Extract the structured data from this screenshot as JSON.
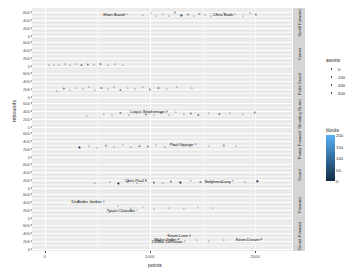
{
  "chart_data": {
    "type": "scatter",
    "title": "",
    "xlabel": "points",
    "ylabel": "rebounds",
    "xlim": [
      -120,
      2350
    ],
    "xticks": [
      0,
      1000,
      2000
    ],
    "grid": true,
    "facet_variable": "position-group",
    "legend_position": "right",
    "facets": [
      {
        "strip": "Small Forward",
        "yticks": [
          0,
          200,
          400,
          600
        ],
        "ylim": [
          -60,
          700
        ],
        "points": [
          {
            "x": 780,
            "y": 560,
            "assists": 180,
            "blocks": 40,
            "label": "Elton Brand"
          },
          {
            "x": 930,
            "y": 520,
            "assists": 120,
            "blocks": 30
          },
          {
            "x": 1010,
            "y": 575,
            "assists": 90,
            "blocks": 60
          },
          {
            "x": 1060,
            "y": 505,
            "assists": 140,
            "blocks": 25
          },
          {
            "x": 1120,
            "y": 545,
            "assists": 110,
            "blocks": 55
          },
          {
            "x": 1180,
            "y": 500,
            "assists": 160,
            "blocks": 35
          },
          {
            "x": 1240,
            "y": 590,
            "assists": 100,
            "blocks": 70
          },
          {
            "x": 1300,
            "y": 515,
            "assists": 130,
            "blocks": 45
          },
          {
            "x": 1360,
            "y": 540,
            "assists": 170,
            "blocks": 50
          },
          {
            "x": 1420,
            "y": 495,
            "assists": 95,
            "blocks": 30
          },
          {
            "x": 1470,
            "y": 560,
            "assists": 150,
            "blocks": 65
          },
          {
            "x": 1520,
            "y": 525,
            "assists": 115,
            "blocks": 40
          },
          {
            "x": 1580,
            "y": 505,
            "assists": 200,
            "blocks": 20
          },
          {
            "x": 1640,
            "y": 545,
            "assists": 125,
            "blocks": 55
          },
          {
            "x": 1700,
            "y": 575,
            "assists": 105,
            "blocks": 75
          },
          {
            "x": 1760,
            "y": 530,
            "assists": 145,
            "blocks": 35
          },
          {
            "x": 1810,
            "y": 555,
            "assists": 135,
            "blocks": 60,
            "label": "Chris Bosh"
          },
          {
            "x": 1880,
            "y": 510,
            "assists": 110,
            "blocks": 45
          },
          {
            "x": 1950,
            "y": 575,
            "assists": 160,
            "blocks": 50
          },
          {
            "x": 2010,
            "y": 540,
            "assists": 120,
            "blocks": 30
          }
        ]
      },
      {
        "strip": "Center",
        "yticks": [
          0,
          200,
          400,
          600
        ],
        "ylim": [
          -60,
          700
        ],
        "points": [
          {
            "x": 40,
            "y": 30,
            "assists": 20,
            "blocks": 10
          },
          {
            "x": 90,
            "y": 45,
            "assists": 30,
            "blocks": 15
          },
          {
            "x": 140,
            "y": 25,
            "assists": 15,
            "blocks": 20
          },
          {
            "x": 190,
            "y": 55,
            "assists": 40,
            "blocks": 12
          },
          {
            "x": 240,
            "y": 35,
            "assists": 25,
            "blocks": 18
          },
          {
            "x": 300,
            "y": 60,
            "assists": 35,
            "blocks": 22
          },
          {
            "x": 350,
            "y": 30,
            "assists": 20,
            "blocks": 8
          },
          {
            "x": 410,
            "y": 50,
            "assists": 45,
            "blocks": 25
          },
          {
            "x": 470,
            "y": 40,
            "assists": 28,
            "blocks": 14
          },
          {
            "x": 530,
            "y": 65,
            "assists": 38,
            "blocks": 30
          },
          {
            "x": 600,
            "y": 35,
            "assists": 22,
            "blocks": 16
          },
          {
            "x": 670,
            "y": 55,
            "assists": 50,
            "blocks": 20
          },
          {
            "x": 740,
            "y": 45,
            "assists": 32,
            "blocks": 24
          }
        ]
      },
      {
        "strip": "Point Guard",
        "yticks": [
          0,
          200,
          400,
          600
        ],
        "ylim": [
          -60,
          700
        ],
        "points": [
          {
            "x": 120,
            "y": 150,
            "assists": 90,
            "blocks": 10
          },
          {
            "x": 180,
            "y": 210,
            "assists": 120,
            "blocks": 15
          },
          {
            "x": 240,
            "y": 170,
            "assists": 80,
            "blocks": 8
          },
          {
            "x": 300,
            "y": 230,
            "assists": 140,
            "blocks": 20
          },
          {
            "x": 360,
            "y": 190,
            "assists": 100,
            "blocks": 12
          },
          {
            "x": 420,
            "y": 250,
            "assists": 160,
            "blocks": 25
          },
          {
            "x": 480,
            "y": 175,
            "assists": 75,
            "blocks": 10
          },
          {
            "x": 540,
            "y": 215,
            "assists": 130,
            "blocks": 18
          },
          {
            "x": 600,
            "y": 195,
            "assists": 110,
            "blocks": 14
          },
          {
            "x": 660,
            "y": 240,
            "assists": 150,
            "blocks": 22
          },
          {
            "x": 720,
            "y": 180,
            "assists": 85,
            "blocks": 9
          },
          {
            "x": 790,
            "y": 225,
            "assists": 135,
            "blocks": 19
          },
          {
            "x": 860,
            "y": 200,
            "assists": 105,
            "blocks": 13
          },
          {
            "x": 930,
            "y": 255,
            "assists": 170,
            "blocks": 28
          },
          {
            "x": 1000,
            "y": 185,
            "assists": 95,
            "blocks": 11
          },
          {
            "x": 1080,
            "y": 230,
            "assists": 145,
            "blocks": 21
          },
          {
            "x": 1160,
            "y": 205,
            "assists": 115,
            "blocks": 16
          },
          {
            "x": 1260,
            "y": 245,
            "assists": 155,
            "blocks": 24
          },
          {
            "x": 1400,
            "y": 215,
            "assists": 125,
            "blocks": 17
          }
        ]
      },
      {
        "strip": "Shooting Guard",
        "yticks": [
          0,
          200,
          400,
          600
        ],
        "ylim": [
          -60,
          700
        ],
        "points": [
          {
            "x": 400,
            "y": 290,
            "assists": 140,
            "blocks": 20
          },
          {
            "x": 560,
            "y": 330,
            "assists": 180,
            "blocks": 28
          },
          {
            "x": 640,
            "y": 300,
            "assists": 120,
            "blocks": 18
          },
          {
            "x": 720,
            "y": 350,
            "assists": 210,
            "blocks": 35
          },
          {
            "x": 800,
            "y": 310,
            "assists": 150,
            "blocks": 22
          },
          {
            "x": 880,
            "y": 365,
            "assists": 240,
            "blocks": 40
          },
          {
            "x": 960,
            "y": 320,
            "assists": 165,
            "blocks": 25
          },
          {
            "x": 1040,
            "y": 295,
            "assists": 130,
            "blocks": 16
          },
          {
            "x": 1110,
            "y": 355,
            "assists": 225,
            "blocks": 38
          },
          {
            "x": 1180,
            "y": 315,
            "assists": 175,
            "blocks": 24
          },
          {
            "x": 1250,
            "y": 380,
            "assists": 260,
            "blocks": 45
          },
          {
            "x": 1320,
            "y": 325,
            "assists": 190,
            "blocks": 27
          },
          {
            "x": 1390,
            "y": 345,
            "assists": 205,
            "blocks": 33
          },
          {
            "x": 1460,
            "y": 305,
            "assists": 145,
            "blocks": 19
          },
          {
            "x": 1560,
            "y": 360,
            "assists": 235,
            "blocks": 42
          },
          {
            "x": 1660,
            "y": 330,
            "assists": 185,
            "blocks": 26
          },
          {
            "x": 1760,
            "y": 350,
            "assists": 215,
            "blocks": 36
          },
          {
            "x": 1160,
            "y": 395,
            "assists": 270,
            "blocks": 48,
            "label": "Lance Stephenson"
          },
          {
            "x": 1880,
            "y": 340,
            "assists": 200,
            "blocks": 30
          },
          {
            "x": 2000,
            "y": 370,
            "assists": 250,
            "blocks": 44
          }
        ]
      },
      {
        "strip": "Power Forward",
        "yticks": [
          0,
          200,
          400,
          600
        ],
        "ylim": [
          -60,
          700
        ],
        "points": [
          {
            "x": 330,
            "y": 250,
            "assists": 70,
            "blocks": 30
          },
          {
            "x": 420,
            "y": 285,
            "assists": 95,
            "blocks": 45
          },
          {
            "x": 500,
            "y": 245,
            "assists": 60,
            "blocks": 25
          },
          {
            "x": 580,
            "y": 300,
            "assists": 110,
            "blocks": 55
          },
          {
            "x": 660,
            "y": 265,
            "assists": 85,
            "blocks": 35
          },
          {
            "x": 740,
            "y": 315,
            "assists": 125,
            "blocks": 65
          },
          {
            "x": 820,
            "y": 255,
            "assists": 75,
            "blocks": 28
          },
          {
            "x": 900,
            "y": 295,
            "assists": 105,
            "blocks": 50
          },
          {
            "x": 980,
            "y": 275,
            "assists": 90,
            "blocks": 40
          },
          {
            "x": 1060,
            "y": 320,
            "assists": 135,
            "blocks": 70
          },
          {
            "x": 1140,
            "y": 260,
            "assists": 80,
            "blocks": 32
          },
          {
            "x": 1230,
            "y": 305,
            "assists": 115,
            "blocks": 58
          },
          {
            "x": 1320,
            "y": 280,
            "assists": 100,
            "blocks": 42
          },
          {
            "x": 1440,
            "y": 330,
            "assists": 145,
            "blocks": 75
          },
          {
            "x": 1560,
            "y": 290,
            "assists": 120,
            "blocks": 48
          },
          {
            "x": 1430,
            "y": 345,
            "assists": 155,
            "blocks": 80,
            "label": "Paul George"
          },
          {
            "x": 1700,
            "y": 300,
            "assists": 130,
            "blocks": 52
          },
          {
            "x": 1820,
            "y": 285,
            "assists": 110,
            "blocks": 44
          }
        ]
      },
      {
        "strip": "Guard",
        "yticks": [
          0,
          200,
          400,
          600
        ],
        "ylim": [
          -60,
          700
        ],
        "points": [
          {
            "x": 480,
            "y": 120,
            "assists": 230,
            "blocks": 8
          },
          {
            "x": 620,
            "y": 150,
            "assists": 290,
            "blocks": 12
          },
          {
            "x": 700,
            "y": 110,
            "assists": 210,
            "blocks": 6
          },
          {
            "x": 790,
            "y": 165,
            "assists": 340,
            "blocks": 15
          },
          {
            "x": 880,
            "y": 130,
            "assists": 260,
            "blocks": 10
          },
          {
            "x": 960,
            "y": 175,
            "assists": 380,
            "blocks": 18
          },
          {
            "x": 1040,
            "y": 140,
            "assists": 300,
            "blocks": 11
          },
          {
            "x": 1120,
            "y": 115,
            "assists": 240,
            "blocks": 7
          },
          {
            "x": 1200,
            "y": 160,
            "assists": 360,
            "blocks": 16
          },
          {
            "x": 1290,
            "y": 135,
            "assists": 280,
            "blocks": 9
          },
          {
            "x": 960,
            "y": 185,
            "assists": 420,
            "blocks": 20,
            "label": "Chris Paul"
          },
          {
            "x": 1390,
            "y": 170,
            "assists": 400,
            "blocks": 17
          },
          {
            "x": 1480,
            "y": 145,
            "assists": 310,
            "blocks": 13
          },
          {
            "x": 1580,
            "y": 180,
            "assists": 440,
            "blocks": 22
          },
          {
            "x": 1680,
            "y": 155,
            "assists": 330,
            "blocks": 14
          },
          {
            "x": 1790,
            "y": 175,
            "assists": 410,
            "blocks": 19,
            "label": "Stephen Curry"
          },
          {
            "x": 1900,
            "y": 150,
            "assists": 350,
            "blocks": 15
          },
          {
            "x": 2020,
            "y": 165,
            "assists": 390,
            "blocks": 21
          }
        ]
      },
      {
        "strip": "Forward",
        "yticks": [
          0,
          200,
          400,
          600
        ],
        "ylim": [
          -60,
          700
        ],
        "points": [
          {
            "x": 560,
            "y": 420,
            "assists": 40,
            "blocks": 130,
            "label": "DeAndre Jordan"
          },
          {
            "x": 700,
            "y": 300,
            "assists": 60,
            "blocks": 90
          },
          {
            "x": 820,
            "y": 250,
            "assists": 50,
            "blocks": 70
          },
          {
            "x": 930,
            "y": 280,
            "assists": 70,
            "blocks": 110
          },
          {
            "x": 1040,
            "y": 230,
            "assists": 45,
            "blocks": 60
          },
          {
            "x": 880,
            "y": 215,
            "assists": 55,
            "blocks": 85,
            "label": "Tyson Chandler"
          },
          {
            "x": 1180,
            "y": 265,
            "assists": 80,
            "blocks": 100
          },
          {
            "x": 1320,
            "y": 240,
            "assists": 65,
            "blocks": 75
          },
          {
            "x": 1460,
            "y": 285,
            "assists": 90,
            "blocks": 120
          },
          {
            "x": 1600,
            "y": 255,
            "assists": 75,
            "blocks": 95
          }
        ]
      },
      {
        "strip": "Guard-Forward",
        "yticks": [
          0,
          200,
          400,
          600
        ],
        "ylim": [
          -60,
          700
        ],
        "points": [
          {
            "x": 1380,
            "y": 330,
            "assists": 120,
            "blocks": 35,
            "label": "Kevin Love"
          },
          {
            "x": 1270,
            "y": 250,
            "assists": 160,
            "blocks": 28,
            "label": "Blake Griffin"
          },
          {
            "x": 1330,
            "y": 200,
            "assists": 190,
            "blocks": 20,
            "label": "DeMar DeRozan"
          },
          {
            "x": 1450,
            "y": 215,
            "assists": 140,
            "blocks": 42
          },
          {
            "x": 2060,
            "y": 240,
            "assists": 175,
            "blocks": 38,
            "label": "Kevin Durant"
          },
          {
            "x": 1560,
            "y": 185,
            "assists": 110,
            "blocks": 25
          },
          {
            "x": 1700,
            "y": 225,
            "assists": 150,
            "blocks": 30
          }
        ]
      }
    ],
    "size_legend": {
      "title": "assists",
      "values": [
        "0",
        "200",
        "400",
        "600"
      ]
    },
    "color_legend": {
      "title": "blocks",
      "ticks": [
        "200",
        "150",
        "100",
        "50",
        "0"
      ],
      "low_color": "#132b43",
      "high_color": "#56b1f7"
    }
  }
}
